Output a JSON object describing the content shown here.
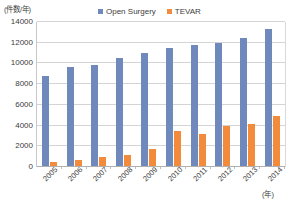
{
  "axes": {
    "y_unit_label": "(件数/年)",
    "x_unit_label": "(年)"
  },
  "legend": {
    "items": [
      {
        "label": "Open Surgery",
        "color": "#7089bc",
        "swatch_name": "legend-swatch-open-surgery"
      },
      {
        "label": "TEVAR",
        "color": "#f28b3c",
        "swatch_name": "legend-swatch-tevar"
      }
    ]
  },
  "chart_data": {
    "type": "bar",
    "title": "",
    "xlabel": "(年)",
    "ylabel": "(件数/年)",
    "ylim": [
      0,
      14000
    ],
    "ytick_step": 2000,
    "yticks": [
      0,
      2000,
      4000,
      6000,
      8000,
      10000,
      12000,
      14000
    ],
    "ytick_labels": [
      "0",
      "2000",
      "4000",
      "6000",
      "8000",
      "10000",
      "12000",
      "14000"
    ],
    "grid": true,
    "legend_position": "top-center",
    "categories": [
      "2005",
      "2006",
      "2007",
      "2008",
      "2009",
      "2010",
      "2011",
      "2012",
      "2013",
      "2014"
    ],
    "series": [
      {
        "name": "Open Surgery",
        "color": "#7089bc",
        "values": [
          8700,
          9550,
          9800,
          10400,
          10900,
          11400,
          11700,
          11900,
          12400,
          13200
        ]
      },
      {
        "name": "TEVAR",
        "color": "#f28b3c",
        "values": [
          400,
          550,
          900,
          1100,
          1650,
          3400,
          3050,
          3900,
          4050,
          4800
        ]
      }
    ]
  }
}
